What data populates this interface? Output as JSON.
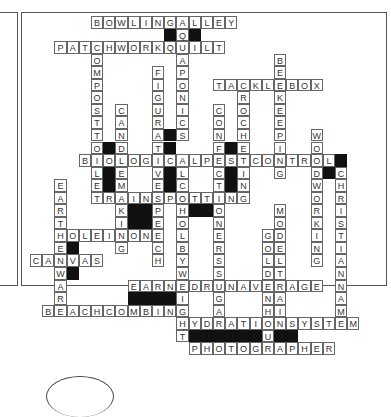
{
  "puzzle": {
    "type": "crossword",
    "cell_w": 12.2,
    "cell_h": 12.55,
    "origin_x": 30,
    "origin_y": 16,
    "words": [
      {
        "answer": "BOWLINGALLEY",
        "row": 0,
        "col": 5,
        "dir": "across"
      },
      {
        "answer": "PATCHWORKQUILT",
        "row": 2,
        "col": 2,
        "dir": "across"
      },
      {
        "answer": "TACKLEBOX",
        "row": 5,
        "col": 15,
        "dir": "across"
      },
      {
        "answer": "BIOLOGICALPESTCONTROL",
        "row": 11,
        "col": 4,
        "dir": "across"
      },
      {
        "answer": "TRAINSPOTTING",
        "row": 14,
        "col": 5,
        "dir": "across"
      },
      {
        "answer": "HOLEINONE",
        "row": 17,
        "col": 2,
        "dir": "across"
      },
      {
        "answer": "CANVAS",
        "row": 19,
        "col": 0,
        "dir": "across"
      },
      {
        "answer": "EARNEDRUNAVERAGE",
        "row": 21,
        "col": 8,
        "dir": "across"
      },
      {
        "answer": "BEACHCOMBING",
        "row": 23,
        "col": 1,
        "dir": "across"
      },
      {
        "answer": "HYDRATIONSYSTEM",
        "row": 24,
        "col": 12,
        "dir": "across"
      },
      {
        "answer": "PHOTOGRAPHER",
        "row": 26,
        "col": 13,
        "dir": "across"
      },
      {
        "answer": "AQUAPONICS",
        "row": 0,
        "col": 12,
        "dir": "down"
      },
      {
        "answer": "COMPOSTTOILET",
        "row": 2,
        "col": 5,
        "dir": "down"
      },
      {
        "answer": "FIGURATIVESPEECH",
        "row": 4,
        "col": 10,
        "dir": "down"
      },
      {
        "answer": "BEEKEEPING",
        "row": 3,
        "col": 20,
        "dir": "down"
      },
      {
        "answer": "CROCHETING",
        "row": 5,
        "col": 17,
        "dir": "down"
      },
      {
        "answer": "CANDLEMAKING",
        "row": 7,
        "col": 7,
        "dir": "down"
      },
      {
        "answer": "CONFECTIONERSSUGAR",
        "row": 7,
        "col": 15,
        "dir": "down"
      },
      {
        "answer": "WOODWORKING",
        "row": 9,
        "col": 23,
        "dir": "down"
      },
      {
        "answer": "ALCOHOLBYWEIGHT",
        "row": 11,
        "col": 12,
        "dir": "down"
      },
      {
        "answer": "CHRISTIANNAME",
        "row": 12,
        "col": 25,
        "dir": "down"
      },
      {
        "answer": "EARTHENWARE",
        "row": 13,
        "col": 2,
        "dir": "down"
      },
      {
        "answer": "MODELTRAIN",
        "row": 15,
        "col": 20,
        "dir": "down"
      },
      {
        "answer": "GOLDENHOUR",
        "row": 17,
        "col": 19,
        "dir": "down"
      }
    ],
    "black_cells": [
      [
        1,
        11
      ],
      [
        1,
        13
      ],
      [
        10,
        6
      ],
      [
        11,
        6
      ],
      [
        12,
        6
      ],
      [
        13,
        6
      ],
      [
        10,
        11
      ],
      [
        9,
        11
      ],
      [
        11,
        11
      ],
      [
        12,
        11
      ],
      [
        13,
        11
      ],
      [
        10,
        16
      ],
      [
        12,
        16
      ],
      [
        13,
        16
      ],
      [
        11,
        25
      ],
      [
        12,
        24
      ],
      [
        15,
        8
      ],
      [
        15,
        9
      ],
      [
        16,
        8
      ],
      [
        16,
        9
      ],
      [
        15,
        13
      ],
      [
        15,
        14
      ],
      [
        18,
        3
      ],
      [
        20,
        3
      ],
      [
        20,
        19
      ],
      [
        21,
        19
      ],
      [
        22,
        8
      ],
      [
        22,
        9
      ],
      [
        22,
        10
      ],
      [
        22,
        11
      ],
      [
        22,
        19
      ],
      [
        23,
        19
      ],
      [
        25,
        13
      ],
      [
        25,
        14
      ],
      [
        25,
        15
      ],
      [
        25,
        16
      ],
      [
        25,
        17
      ],
      [
        25,
        18
      ],
      [
        25,
        20
      ],
      [
        25,
        21
      ]
    ]
  }
}
